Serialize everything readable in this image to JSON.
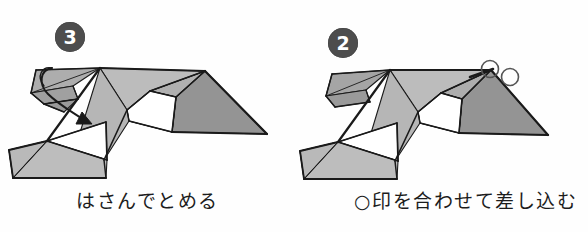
{
  "page": {
    "background_color": "#fefefe",
    "width": 588,
    "height": 232,
    "kind": "origami-instruction-diagram"
  },
  "palette": {
    "ink": "#1c1c1c",
    "stroke": "#1a1a1a",
    "light_gray": "#bcbcbc",
    "mid_gray": "#a8a8a8",
    "dark_gray": "#949494",
    "deep_gray": "#8a8a8a",
    "white_face": "#ffffff",
    "badge_fill": "#4d4d4d",
    "badge_text": "#ffffff"
  },
  "steps": [
    {
      "id": "step-3",
      "number": "3",
      "caption": "はさんでとめる",
      "caption_x": 76,
      "caption_y": 186,
      "badge_x": 55,
      "badge_y": 22,
      "annotation": {
        "type": "curved-fold-arrow",
        "description": "curved arrow tucking the left flap down and to the right",
        "arrow_path": "M 52 68 C 40 70 38 84 48 94 C 58 104 72 112 84 120",
        "arrow_head": "82,112 92,124 76,124",
        "loop_path": "M 52 68 C 42 66 36 76 44 86"
      },
      "marks": []
    },
    {
      "id": "step-2",
      "number": "2",
      "caption": "○印を合わせて差し込む",
      "caption_x": 60,
      "caption_y": 186,
      "badge_x": 34,
      "badge_y": 28,
      "annotation": null,
      "marks": [
        {
          "name": "circle-mark-left",
          "cx": 196,
          "cy": 69,
          "r": 8.5
        },
        {
          "name": "circle-mark-right",
          "cx": 216,
          "cy": 77,
          "r": 8.5
        }
      ]
    }
  ],
  "figure_step3": {
    "faces": [
      {
        "name": "right-wing-dark",
        "points": "205,71 267,134 172,132 176,97",
        "fill": "#949494"
      },
      {
        "name": "right-wing-upper",
        "points": "150,91 205,71 176,97",
        "fill": "#b0b0b0"
      },
      {
        "name": "top-sail-light",
        "points": "100,68 205,71 150,91 127,110",
        "fill": "#bcbcbc"
      },
      {
        "name": "top-sail-right",
        "points": "150,91 176,97 172,132 129,121",
        "fill": "#b4b4b4"
      },
      {
        "name": "center-white",
        "points": "127,110 150,91 176,97 172,132 129,121",
        "fill": "#ffffff"
      },
      {
        "name": "center-band",
        "points": "100,68 127,110 129,121 104,160 74,152",
        "fill": "#b6b6b6"
      },
      {
        "name": "lower-white",
        "points": "47,141 104,160 104,161 48,142",
        "fill": "#ffffff"
      },
      {
        "name": "body-white-tri",
        "points": "47,141 106,122 107,160",
        "fill": "#ffffff"
      },
      {
        "name": "lower-left-body",
        "points": "47,141 107,160 106,178 13,178 9,150",
        "fill": "#bdbdbd"
      },
      {
        "name": "tail-left",
        "points": "9,150 47,141 13,178",
        "fill": "#b9b9b9"
      },
      {
        "name": "left-flap-top",
        "points": "36,70 100,68 73,86 31,93",
        "fill": "#adadad"
      },
      {
        "name": "left-flap-lower",
        "points": "31,93 73,86 78,99 44,104",
        "fill": "#a0a0a0"
      },
      {
        "name": "left-flap-edge",
        "points": "44,104 78,99 64,112",
        "fill": "#9a9a9a"
      }
    ],
    "creases": [
      {
        "name": "crease-top-ridge",
        "d": "M 100 68 L 205 71",
        "w": 2.0
      },
      {
        "name": "crease-right-fold",
        "d": "M 205 71 L 267 134",
        "w": 2.2
      },
      {
        "name": "crease-right-lower",
        "d": "M 267 134 L 172 132",
        "w": 2.0
      },
      {
        "name": "crease-diag-a",
        "d": "M 205 71 L 176 97",
        "w": 1.3
      },
      {
        "name": "crease-diag-b",
        "d": "M 150 91 L 205 71",
        "w": 1.6
      },
      {
        "name": "crease-wing-inner",
        "d": "M 176 97 L 172 132",
        "w": 1.6
      },
      {
        "name": "crease-center-a",
        "d": "M 127 110 L 150 91",
        "w": 1.6
      },
      {
        "name": "crease-center-b",
        "d": "M 150 91 L 176 97",
        "w": 1.5
      },
      {
        "name": "crease-center-c",
        "d": "M 129 121 L 172 132",
        "w": 1.6
      },
      {
        "name": "crease-center-d",
        "d": "M 127 110 L 129 121",
        "w": 1.4
      },
      {
        "name": "crease-left-long",
        "d": "M 100 68 L 47 141",
        "w": 2.2
      },
      {
        "name": "crease-band-left",
        "d": "M 127 110 L 104 160",
        "w": 1.6
      },
      {
        "name": "crease-band-bot",
        "d": "M 104 160 L 106 178",
        "w": 1.5
      },
      {
        "name": "crease-white-top",
        "d": "M 47 141 L 106 122",
        "w": 1.7
      },
      {
        "name": "crease-white-diag",
        "d": "M 47 141 L 107 160",
        "w": 1.7
      },
      {
        "name": "crease-white-vert",
        "d": "M 106 122 L 107 160",
        "w": 1.7
      },
      {
        "name": "crease-tail-upper",
        "d": "M 9 150 L 47 141",
        "w": 1.8
      },
      {
        "name": "crease-tail-left",
        "d": "M 9 150 L 13 178",
        "w": 1.8
      },
      {
        "name": "crease-tail-bottom",
        "d": "M 13 178 L 106 178",
        "w": 1.8
      },
      {
        "name": "crease-tail-thin",
        "d": "M 13 178 L 47 141",
        "w": 0.9
      },
      {
        "name": "crease-flap-top",
        "d": "M 36 70 L 100 68",
        "w": 1.5
      },
      {
        "name": "crease-flap-left",
        "d": "M 36 70 L 31 93",
        "w": 1.5
      },
      {
        "name": "crease-flap-bot",
        "d": "M 31 93 L 44 104",
        "w": 1.5
      },
      {
        "name": "crease-flap-edge",
        "d": "M 44 104 L 78 99",
        "w": 1.5
      },
      {
        "name": "crease-flap-inner",
        "d": "M 73 86 L 78 99",
        "w": 1.2
      },
      {
        "name": "crease-flap-diag",
        "d": "M 31 93 L 100 68",
        "w": 0.9
      },
      {
        "name": "crease-flap-tip",
        "d": "M 44 104 L 64 112",
        "w": 1.4
      }
    ]
  },
  "figure_step2": {
    "faces": [
      {
        "name": "right-wing-dark",
        "points": "197,70 254,135 165,133 168,99",
        "fill": "#949494"
      },
      {
        "name": "right-wing-upper",
        "points": "147,93 197,70 168,99",
        "fill": "#adadad"
      },
      {
        "name": "top-sail-light",
        "points": "96,70 197,70 147,93 124,112",
        "fill": "#bcbcbc"
      },
      {
        "name": "top-sail-right",
        "points": "147,93 168,99 165,133 126,123",
        "fill": "#b4b4b4"
      },
      {
        "name": "center-white",
        "points": "124,112 147,93 168,99 165,133 126,123",
        "fill": "#ffffff"
      },
      {
        "name": "center-band",
        "points": "96,70 124,112 126,123 101,161 71,153",
        "fill": "#b6b6b6"
      },
      {
        "name": "body-white-tri",
        "points": "44,142 103,123 104,161",
        "fill": "#ffffff"
      },
      {
        "name": "lower-left-body",
        "points": "44,142 104,161 103,179 10,179 6,151",
        "fill": "#bdbdbd"
      },
      {
        "name": "tail-left",
        "points": "6,151 44,142 10,179",
        "fill": "#b9b9b9"
      },
      {
        "name": "left-flap-top",
        "points": "38,74 96,70 72,90 32,96",
        "fill": "#a5a5a5"
      },
      {
        "name": "left-flap-lower",
        "points": "32,96 72,90 76,102 41,107",
        "fill": "#9a9a9a"
      }
    ],
    "creases": [
      {
        "name": "crease-top-ridge",
        "d": "M 96 70 L 197 70",
        "w": 2.0
      },
      {
        "name": "crease-right-fold",
        "d": "M 197 70 L 254 135",
        "w": 2.2
      },
      {
        "name": "crease-right-lower",
        "d": "M 254 135 L 165 133",
        "w": 2.0
      },
      {
        "name": "crease-diag-a",
        "d": "M 197 70 L 168 99",
        "w": 1.3
      },
      {
        "name": "crease-diag-b",
        "d": "M 147 93 L 197 70",
        "w": 1.8
      },
      {
        "name": "crease-wing-inner",
        "d": "M 168 99 L 165 133",
        "w": 1.6
      },
      {
        "name": "crease-center-a",
        "d": "M 124 112 L 147 93",
        "w": 1.6
      },
      {
        "name": "crease-center-b",
        "d": "M 147 93 L 168 99",
        "w": 1.5
      },
      {
        "name": "crease-center-c",
        "d": "M 126 123 L 165 133",
        "w": 1.6
      },
      {
        "name": "crease-center-d",
        "d": "M 124 112 L 126 123",
        "w": 1.4
      },
      {
        "name": "crease-left-long",
        "d": "M 96 70 L 44 142",
        "w": 2.2
      },
      {
        "name": "crease-band-left",
        "d": "M 124 112 L 101 161",
        "w": 1.6
      },
      {
        "name": "crease-band-bot",
        "d": "M 101 161 L 103 179",
        "w": 1.5
      },
      {
        "name": "crease-white-top",
        "d": "M 44 142 L 103 123",
        "w": 1.7
      },
      {
        "name": "crease-white-diag",
        "d": "M 44 142 L 104 161",
        "w": 1.7
      },
      {
        "name": "crease-white-vert",
        "d": "M 103 123 L 104 161",
        "w": 1.7
      },
      {
        "name": "crease-tail-upper",
        "d": "M 6 151 L 44 142",
        "w": 1.8
      },
      {
        "name": "crease-tail-left",
        "d": "M 6 151 L 10 179",
        "w": 1.8
      },
      {
        "name": "crease-tail-bottom",
        "d": "M 10 179 L 103 179",
        "w": 1.8
      },
      {
        "name": "crease-tail-thin",
        "d": "M 10 179 L 44 142",
        "w": 0.9
      },
      {
        "name": "crease-flap-top",
        "d": "M 38 74 L 96 70",
        "w": 1.5
      },
      {
        "name": "crease-flap-left",
        "d": "M 38 74 L 32 96",
        "w": 1.5
      },
      {
        "name": "crease-flap-bot",
        "d": "M 32 96 L 41 107",
        "w": 1.5
      },
      {
        "name": "crease-flap-edge",
        "d": "M 41 107 L 76 102",
        "w": 1.5
      },
      {
        "name": "crease-flap-inner",
        "d": "M 72 90 L 76 102",
        "w": 1.2
      },
      {
        "name": "crease-flap-diag",
        "d": "M 32 96 L 96 70",
        "w": 0.9
      },
      {
        "name": "crease-mark-spur",
        "d": "M 176 77 L 199 69",
        "w": 2.6
      }
    ]
  }
}
